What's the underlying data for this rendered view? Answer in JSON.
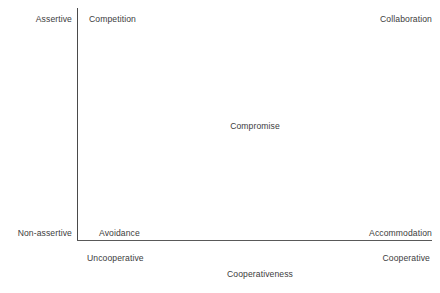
{
  "chart_data": {
    "type": "scatter",
    "title": "",
    "xlabel": "Cooperativeness",
    "ylabel": "",
    "grid": false,
    "legend": "none",
    "x_axis": {
      "label": "Cooperativeness",
      "low_label": "Uncooperative",
      "high_label": "Cooperative"
    },
    "y_axis": {
      "label": "",
      "low_label": "Non-assertive",
      "high_label": "Assertive"
    },
    "points": [
      {
        "label": "Competition",
        "x": "Uncooperative",
        "y": "Assertive"
      },
      {
        "label": "Collaboration",
        "x": "Cooperative",
        "y": "Assertive"
      },
      {
        "label": "Compromise",
        "x": "Middle",
        "y": "Middle"
      },
      {
        "label": "Avoidance",
        "x": "Uncooperative",
        "y": "Non-assertive"
      },
      {
        "label": "Accommodation",
        "x": "Cooperative",
        "y": "Non-assertive"
      }
    ]
  },
  "axes": {
    "y_high": "Assertive",
    "y_low": "Non-assertive",
    "x_low": "Uncooperative",
    "x_high": "Cooperative",
    "x_title": "Cooperativeness"
  },
  "modes": {
    "top_left": "Competition",
    "top_right": "Collaboration",
    "center": "Compromise",
    "bottom_left": "Avoidance",
    "bottom_right": "Accommodation"
  },
  "colors": {
    "background": "#ffffff",
    "axis_line": "#4a4a4a",
    "text": "#3c3c3c"
  }
}
